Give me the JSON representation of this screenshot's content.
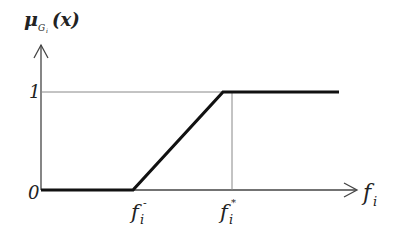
{
  "diagram": {
    "type": "membership-function",
    "y_axis": {
      "label_mu": "μ",
      "label_sub": "G",
      "label_subsub": "i",
      "label_arg": "(x)"
    },
    "x_axis": {
      "label_base": "f",
      "label_sub": "i"
    },
    "ticks": {
      "origin": "0",
      "one": "1",
      "f_minus_base": "f",
      "f_minus_sub": "i",
      "f_minus_sup": "-",
      "f_star_base": "f",
      "f_star_sub": "i",
      "f_star_sup": "*"
    },
    "colors": {
      "axis": "#444444",
      "curve": "#111111",
      "guide": "#888888"
    }
  }
}
